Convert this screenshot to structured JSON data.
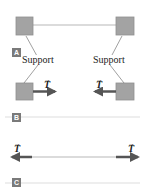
{
  "panels": [
    {
      "id": "A",
      "label": "A"
    },
    {
      "id": "B",
      "label": "B"
    },
    {
      "id": "C",
      "label": "C"
    }
  ],
  "panel_a": {
    "support_left": "Support",
    "support_right": "Support",
    "tension_left": "T",
    "tension_right": "T"
  },
  "panel_b": {
    "tension_left": "T",
    "tension_right": "T"
  },
  "vector_symbol": "→",
  "colors": {
    "block_fill": "#a3a3a3",
    "block_border": "#8a8a8a",
    "arrow": "#555555",
    "rope": "#cfcfcf",
    "divider": "#dddddd",
    "label_bg": "#7a7a7a"
  }
}
